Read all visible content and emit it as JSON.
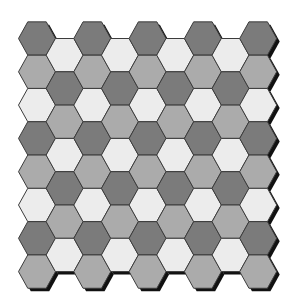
{
  "grid": {
    "type": "hexagonal-tiling",
    "orientation": "flat-top",
    "columns": 9,
    "even_column_rows": 8,
    "odd_column_rows": 7,
    "hex_width": 37,
    "hex_height": 33.3,
    "column_step": 27.65,
    "origin_x": 37,
    "origin_y": 38.5,
    "shadow_offset": 3
  },
  "colors": {
    "background": "#ffffff",
    "dark": "#7b7b7b",
    "medium": "#ababab",
    "light": "#ececec",
    "outline": "#3c3c3c",
    "shadow": "#111111"
  },
  "columns": [
    [
      "dark",
      "medium",
      "light",
      "dark",
      "medium",
      "light",
      "dark",
      "medium"
    ],
    [
      "light",
      "dark",
      "medium",
      "light",
      "dark",
      "medium",
      "light"
    ],
    [
      "dark",
      "medium",
      "light",
      "dark",
      "medium",
      "light",
      "dark",
      "medium"
    ],
    [
      "light",
      "dark",
      "medium",
      "light",
      "dark",
      "medium",
      "light"
    ],
    [
      "dark",
      "medium",
      "light",
      "dark",
      "medium",
      "light",
      "dark",
      "medium"
    ],
    [
      "light",
      "dark",
      "medium",
      "light",
      "dark",
      "medium",
      "light"
    ],
    [
      "dark",
      "medium",
      "light",
      "dark",
      "medium",
      "light",
      "dark",
      "medium"
    ],
    [
      "light",
      "dark",
      "medium",
      "light",
      "dark",
      "medium",
      "light"
    ],
    [
      "dark",
      "medium",
      "light",
      "dark",
      "medium",
      "light",
      "dark",
      "medium"
    ]
  ]
}
